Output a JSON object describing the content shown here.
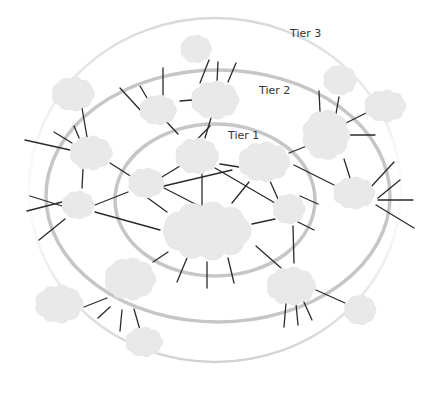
{
  "diagram": {
    "labels": [
      {
        "id": "tier3",
        "text": "Tier 3",
        "x": 290,
        "y": 35
      },
      {
        "id": "tier2",
        "text": "Tier 2",
        "x": 259,
        "y": 83
      },
      {
        "id": "tier1",
        "text": "Tier 1",
        "x": 228,
        "y": 128
      }
    ],
    "colors": {
      "background": "#ffffff",
      "cloud": "#e8e8e8",
      "ring_inner": "#c6c6c6",
      "ring_middle": "#c6c6c6",
      "ring_outer": "#d4d4d4",
      "link": "#2a2a2a",
      "label": "#333333"
    },
    "rings": [
      {
        "id": "tier1-ring",
        "cx": 215,
        "cy": 200,
        "rx": 100,
        "ry": 76,
        "width": 3.5
      },
      {
        "id": "tier2-ring",
        "cx": 218,
        "cy": 196,
        "rx": 172,
        "ry": 126,
        "width": 3.5
      },
      {
        "id": "tier3-ring",
        "cx": 215,
        "cy": 190,
        "rx": 186,
        "ry": 172,
        "width": 2.5
      }
    ],
    "clouds": [
      {
        "id": "core",
        "tier": 1,
        "cx": 207,
        "cy": 231,
        "rx": 49,
        "ry": 29
      },
      {
        "id": "t1-top",
        "tier": 1,
        "cx": 197,
        "cy": 156,
        "rx": 22,
        "ry": 18
      },
      {
        "id": "t1-right",
        "tier": 1,
        "cx": 264,
        "cy": 162,
        "rx": 27,
        "ry": 20
      },
      {
        "id": "t1-left",
        "tier": 1,
        "cx": 146,
        "cy": 183,
        "rx": 18,
        "ry": 15
      },
      {
        "id": "t1-small-right",
        "tier": 1,
        "cx": 289,
        "cy": 209,
        "rx": 15,
        "ry": 15
      },
      {
        "id": "t2-top-center",
        "tier": 2,
        "cx": 215,
        "cy": 100,
        "rx": 25,
        "ry": 19
      },
      {
        "id": "t2-top-left",
        "tier": 2,
        "cx": 158,
        "cy": 110,
        "rx": 19,
        "ry": 15
      },
      {
        "id": "t2-left",
        "tier": 2,
        "cx": 91,
        "cy": 153,
        "rx": 22,
        "ry": 17
      },
      {
        "id": "t2-far-left",
        "tier": 2,
        "cx": 78,
        "cy": 205,
        "rx": 16,
        "ry": 14
      },
      {
        "id": "t2-right-upper",
        "tier": 2,
        "cx": 326,
        "cy": 135,
        "rx": 22,
        "ry": 27
      },
      {
        "id": "t2-right",
        "tier": 2,
        "cx": 354,
        "cy": 193,
        "rx": 22,
        "ry": 16
      },
      {
        "id": "t2-bottom-left",
        "tier": 2,
        "cx": 130,
        "cy": 279,
        "rx": 26,
        "ry": 21
      },
      {
        "id": "t2-bottom-right",
        "tier": 2,
        "cx": 291,
        "cy": 286,
        "rx": 26,
        "ry": 19
      },
      {
        "id": "t3-top",
        "tier": 3,
        "cx": 196,
        "cy": 49,
        "rx": 15,
        "ry": 14
      },
      {
        "id": "t3-top-left",
        "tier": 3,
        "cx": 73,
        "cy": 94,
        "rx": 22,
        "ry": 17
      },
      {
        "id": "t3-top-right",
        "tier": 3,
        "cx": 340,
        "cy": 80,
        "rx": 16,
        "ry": 15
      },
      {
        "id": "t3-right",
        "tier": 3,
        "cx": 385,
        "cy": 106,
        "rx": 22,
        "ry": 16
      },
      {
        "id": "t3-bottom-left",
        "tier": 3,
        "cx": 59,
        "cy": 304,
        "rx": 25,
        "ry": 19
      },
      {
        "id": "t3-bottom",
        "tier": 3,
        "cx": 144,
        "cy": 342,
        "rx": 19,
        "ry": 15
      },
      {
        "id": "t3-bottom-right",
        "tier": 3,
        "cx": 360,
        "cy": 310,
        "rx": 15,
        "ry": 15
      }
    ],
    "links": [
      [
        188,
        149,
        210,
        126
      ],
      [
        205,
        138,
        211,
        118
      ],
      [
        178,
        134,
        163,
        118
      ],
      [
        180,
        101,
        192,
        100
      ],
      [
        200,
        83,
        209,
        60
      ],
      [
        217,
        82,
        218,
        62
      ],
      [
        228,
        82,
        236,
        63
      ],
      [
        120,
        88,
        142,
        112
      ],
      [
        140,
        86,
        150,
        103
      ],
      [
        163,
        68,
        163,
        95
      ],
      [
        82,
        108,
        87,
        137
      ],
      [
        80,
        140,
        74,
        126
      ],
      [
        72,
        143,
        54,
        132
      ],
      [
        25,
        140,
        70,
        150
      ],
      [
        110,
        163,
        132,
        177
      ],
      [
        83,
        169,
        82,
        188
      ],
      [
        95,
        205,
        128,
        192
      ],
      [
        30,
        196,
        62,
        206
      ],
      [
        27,
        211,
        62,
        202
      ],
      [
        39,
        240,
        65,
        219
      ],
      [
        164,
        186,
        232,
        170
      ],
      [
        164,
        188,
        238,
        226
      ],
      [
        145,
        196,
        167,
        212
      ],
      [
        162,
        177,
        180,
        166
      ],
      [
        148,
        172,
        148,
        172
      ],
      [
        202,
        173,
        202,
        205
      ],
      [
        220,
        164,
        239,
        167
      ],
      [
        215,
        168,
        275,
        203
      ],
      [
        232,
        203,
        249,
        182
      ],
      [
        95,
        212,
        160,
        230
      ],
      [
        252,
        224,
        275,
        219
      ],
      [
        270,
        181,
        278,
        199
      ],
      [
        294,
        165,
        334,
        185
      ],
      [
        289,
        153,
        312,
        144
      ],
      [
        300,
        196,
        318,
        204
      ],
      [
        298,
        222,
        314,
        230
      ],
      [
        293,
        226,
        294,
        263
      ],
      [
        256,
        246,
        281,
        268
      ],
      [
        168,
        252,
        153,
        262
      ],
      [
        187,
        258,
        177,
        282
      ],
      [
        207,
        262,
        207,
        288
      ],
      [
        228,
        258,
        234,
        283
      ],
      [
        319,
        91,
        320,
        112
      ],
      [
        339,
        97,
        335,
        119
      ],
      [
        340,
        126,
        366,
        113
      ],
      [
        348,
        135,
        375,
        135
      ],
      [
        344,
        159,
        350,
        178
      ],
      [
        370,
        188,
        394,
        162
      ],
      [
        378,
        198,
        400,
        180
      ],
      [
        378,
        200,
        413,
        200
      ],
      [
        376,
        205,
        414,
        228
      ],
      [
        84,
        307,
        107,
        298
      ],
      [
        98,
        318,
        110,
        307
      ],
      [
        120,
        331,
        122,
        310
      ],
      [
        140,
        330,
        134,
        309
      ],
      [
        273,
        297,
        280,
        295
      ],
      [
        284,
        327,
        286,
        303
      ],
      [
        298,
        325,
        296,
        304
      ],
      [
        312,
        320,
        303,
        300
      ],
      [
        345,
        303,
        316,
        290
      ],
      [
        100,
        308,
        100,
        308
      ]
    ]
  }
}
